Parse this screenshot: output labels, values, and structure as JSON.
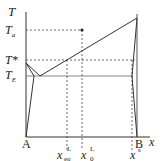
{
  "diagram": {
    "type": "binary phase diagram",
    "axis_labels": {
      "y": "T",
      "x": "x"
    },
    "y_ticks": [
      {
        "main": "T",
        "sub": "a"
      },
      {
        "main": "T*",
        "sub": ""
      },
      {
        "main": "T",
        "sub": "E"
      }
    ],
    "endpoints": {
      "left": "A",
      "right": "B"
    },
    "x_markers": [
      {
        "main": "x",
        "sup": "L",
        "sub": "eq"
      },
      {
        "main": "x",
        "sup": "L",
        "sub": "0"
      },
      {
        "main": "x",
        "sup": "s",
        "sub": ""
      }
    ],
    "colors": {
      "line": "#333333",
      "dashed": "#444444",
      "eutectic": "#777777"
    }
  }
}
